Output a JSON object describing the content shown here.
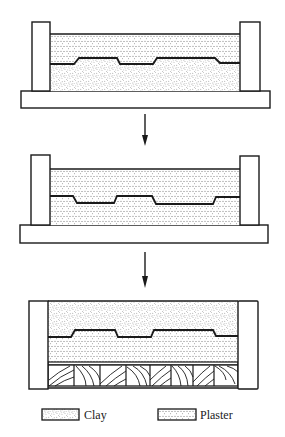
{
  "figure": {
    "colors": {
      "ink": "#1a1a1a",
      "background": "#ffffff",
      "clay_dot": "#6a6a6a",
      "plaster_dot": "#555555"
    },
    "steps": [
      {
        "id": "step-1",
        "top_layer": "Plaster",
        "bottom_layer": "Clay",
        "support": "Base board"
      },
      {
        "id": "step-2",
        "top_layer": "Plaster",
        "bottom_layer": "Plaster",
        "support": "Base board"
      },
      {
        "id": "step-3",
        "top_layer": "Clay",
        "bottom_layer": "Plaster",
        "support": "Wood blocks"
      }
    ],
    "arrows": [
      {
        "from": "step-1",
        "to": "step-2",
        "direction": "down"
      },
      {
        "from": "step-2",
        "to": "step-3",
        "direction": "down"
      }
    ]
  },
  "legend": {
    "items": [
      {
        "label": "Clay",
        "pattern": "clay"
      },
      {
        "label": "Plaster",
        "pattern": "plaster"
      }
    ]
  }
}
